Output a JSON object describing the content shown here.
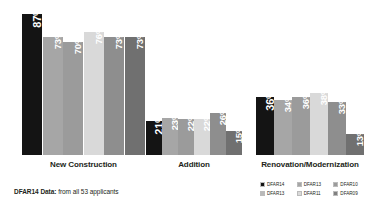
{
  "footnote": {
    "strong": "DFAR14 Data:",
    "rest": " from all 53 applicants"
  },
  "legend": {
    "items": [
      {
        "label": "DFAR14",
        "color": "#141414"
      },
      {
        "label": "DFAR13",
        "color": "#a6a6a6"
      },
      {
        "label": "DFAR10",
        "color": "#9b9b9b"
      },
      {
        "label": "DFAR13",
        "color": "#b9b9b9"
      },
      {
        "label": "DFAR11",
        "color": "#d9d9d9"
      },
      {
        "label": "DFAR09",
        "color": "#808080"
      }
    ]
  },
  "chart_data": {
    "type": "bar",
    "title": "",
    "xlabel": "",
    "ylabel": "",
    "ylim": [
      0,
      100
    ],
    "grid": false,
    "legend_position": "bottom-right",
    "categories": [
      "New Construction",
      "Addition",
      "Renovation/Modernization"
    ],
    "series": [
      {
        "name": "DFAR14",
        "color": "#141414",
        "values": [
          87,
          21,
          36
        ]
      },
      {
        "name": "DFAR13",
        "color": "#a6a6a6",
        "values": [
          73,
          23,
          34
        ]
      },
      {
        "name": "DFAR12",
        "color": "#9b9b9b",
        "values": [
          70,
          22,
          36
        ]
      },
      {
        "name": "DFAR11",
        "color": "#d9d9d9",
        "values": [
          76,
          22,
          38
        ]
      },
      {
        "name": "DFAR10",
        "color": "#8e8e8e",
        "values": [
          73,
          26,
          33
        ]
      },
      {
        "name": "DFAR09",
        "color": "#707070",
        "values": [
          73,
          15,
          13
        ]
      }
    ],
    "value_labels": [
      [
        "87%",
        "73%",
        "70%",
        "76%",
        "73%",
        "73%"
      ],
      [
        "21%",
        "23%",
        "22%",
        "22%",
        "26%",
        "15%"
      ],
      [
        "36%",
        "34%",
        "36%",
        "38%",
        "33%",
        "13%"
      ]
    ],
    "groups": [
      {
        "label": "New Construction",
        "left": 22,
        "bar_width": 20,
        "gap": 0.6
      },
      {
        "label": "Addition",
        "left": 146,
        "bar_width": 15.5,
        "gap": 0.6
      },
      {
        "label": "Renovation/Modernization",
        "left": 256,
        "bar_width": 17.5,
        "gap": 0.6
      }
    ],
    "scale_px_per_unit": 1.62
  }
}
